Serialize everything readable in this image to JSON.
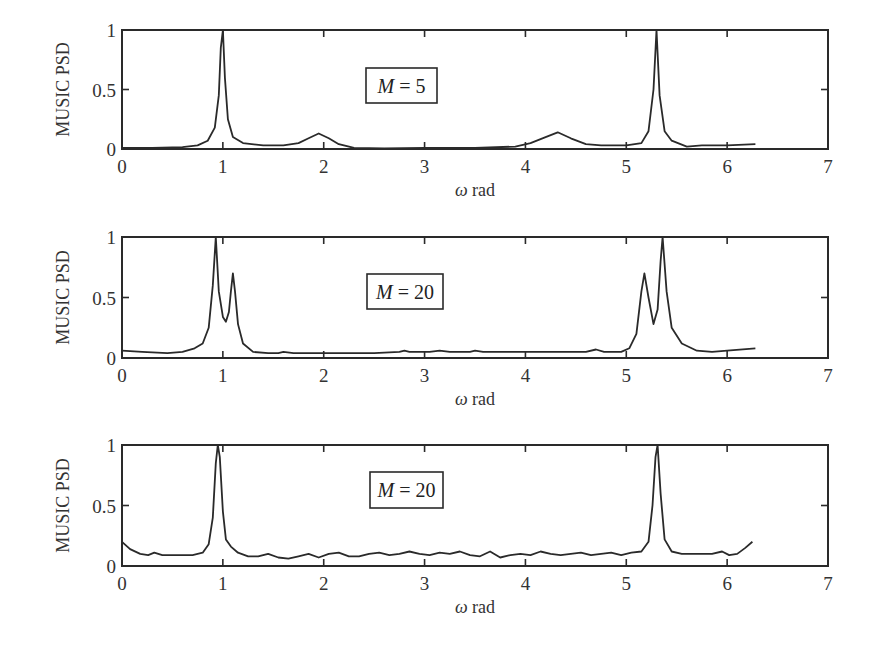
{
  "figure": {
    "panels": [
      {
        "id": "panel-1",
        "ylabel": "MUSIC PSD",
        "xlabel_symbol": "ω",
        "xlabel_unit": " rad",
        "annotation_var": "M",
        "annotation_rest": " = 5"
      },
      {
        "id": "panel-2",
        "ylabel": "MUSIC PSD",
        "xlabel_symbol": "ω",
        "xlabel_unit": " rad",
        "annotation_var": "M",
        "annotation_rest": " = 20"
      },
      {
        "id": "panel-3",
        "ylabel": "MUSIC PSD",
        "xlabel_symbol": "ω",
        "xlabel_unit": " rad",
        "annotation_var": "M",
        "annotation_rest": " = 20"
      }
    ]
  },
  "chart_data": [
    {
      "type": "line",
      "title": "",
      "annotation": "M = 5",
      "xlabel": "ω rad",
      "ylabel": "MUSIC PSD",
      "xlim": [
        0,
        7
      ],
      "ylim": [
        0,
        1
      ],
      "xticks": [
        "0",
        "1",
        "2",
        "3",
        "4",
        "5",
        "6",
        "7"
      ],
      "yticks": [
        "0",
        "0.5",
        "1"
      ],
      "grid": false,
      "series": [
        {
          "name": "MUSIC PSD (M = 5)",
          "x": [
            0,
            0.3,
            0.6,
            0.75,
            0.85,
            0.92,
            0.96,
            0.98,
            1.0,
            1.02,
            1.05,
            1.1,
            1.2,
            1.4,
            1.6,
            1.75,
            1.85,
            1.95,
            2.05,
            2.15,
            2.3,
            2.6,
            3.0,
            3.5,
            3.9,
            4.05,
            4.2,
            4.32,
            4.45,
            4.6,
            4.75,
            5.0,
            5.15,
            5.22,
            5.27,
            5.3,
            5.33,
            5.38,
            5.45,
            5.6,
            5.75,
            6.0,
            6.28
          ],
          "values": [
            0.01,
            0.01,
            0.015,
            0.03,
            0.07,
            0.18,
            0.45,
            0.85,
            1.0,
            0.6,
            0.25,
            0.1,
            0.05,
            0.03,
            0.03,
            0.05,
            0.09,
            0.13,
            0.09,
            0.04,
            0.01,
            0.005,
            0.01,
            0.01,
            0.02,
            0.05,
            0.1,
            0.14,
            0.09,
            0.04,
            0.03,
            0.03,
            0.05,
            0.15,
            0.5,
            1.0,
            0.45,
            0.15,
            0.07,
            0.02,
            0.03,
            0.03,
            0.04
          ]
        }
      ]
    },
    {
      "type": "line",
      "title": "",
      "annotation": "M = 20",
      "xlabel": "ω rad",
      "ylabel": "MUSIC PSD",
      "xlim": [
        0,
        7
      ],
      "ylim": [
        0,
        1
      ],
      "xticks": [
        "0",
        "1",
        "2",
        "3",
        "4",
        "5",
        "6",
        "7"
      ],
      "yticks": [
        "0",
        "0.5",
        "1"
      ],
      "grid": false,
      "series": [
        {
          "name": "MUSIC PSD (M = 20)",
          "x": [
            0,
            0.2,
            0.45,
            0.6,
            0.72,
            0.8,
            0.86,
            0.9,
            0.93,
            0.96,
            1.0,
            1.03,
            1.06,
            1.08,
            1.1,
            1.12,
            1.15,
            1.2,
            1.3,
            1.45,
            1.55,
            1.6,
            1.7,
            2.0,
            2.5,
            2.75,
            2.8,
            2.85,
            3.05,
            3.15,
            3.25,
            3.45,
            3.5,
            3.58,
            4.0,
            4.6,
            4.7,
            4.78,
            4.95,
            5.03,
            5.1,
            5.15,
            5.18,
            5.22,
            5.27,
            5.31,
            5.34,
            5.36,
            5.4,
            5.45,
            5.55,
            5.7,
            5.85,
            6.0,
            6.28
          ],
          "values": [
            0.06,
            0.05,
            0.04,
            0.05,
            0.08,
            0.12,
            0.25,
            0.6,
            1.0,
            0.55,
            0.34,
            0.3,
            0.38,
            0.55,
            0.7,
            0.55,
            0.28,
            0.12,
            0.05,
            0.04,
            0.04,
            0.05,
            0.04,
            0.04,
            0.04,
            0.05,
            0.06,
            0.05,
            0.05,
            0.06,
            0.05,
            0.05,
            0.06,
            0.05,
            0.05,
            0.05,
            0.07,
            0.05,
            0.05,
            0.08,
            0.2,
            0.55,
            0.7,
            0.5,
            0.28,
            0.4,
            0.8,
            1.0,
            0.55,
            0.25,
            0.12,
            0.06,
            0.05,
            0.06,
            0.08
          ]
        }
      ]
    },
    {
      "type": "line",
      "title": "",
      "annotation": "M = 20",
      "xlabel": "ω rad",
      "ylabel": "MUSIC PSD",
      "xlim": [
        0,
        7
      ],
      "ylim": [
        0,
        1
      ],
      "xticks": [
        "0",
        "1",
        "2",
        "3",
        "4",
        "5",
        "6",
        "7"
      ],
      "yticks": [
        "0",
        "0.5",
        "1"
      ],
      "grid": false,
      "series": [
        {
          "name": "MUSIC PSD (M = 20, noisy estimate)",
          "x": [
            0,
            0.08,
            0.18,
            0.26,
            0.32,
            0.4,
            0.55,
            0.7,
            0.8,
            0.86,
            0.9,
            0.93,
            0.95,
            0.97,
            1.0,
            1.03,
            1.08,
            1.15,
            1.25,
            1.35,
            1.45,
            1.55,
            1.65,
            1.75,
            1.85,
            1.95,
            2.05,
            2.15,
            2.25,
            2.35,
            2.45,
            2.55,
            2.65,
            2.75,
            2.85,
            2.95,
            3.05,
            3.15,
            3.25,
            3.35,
            3.45,
            3.55,
            3.65,
            3.75,
            3.85,
            3.95,
            4.05,
            4.15,
            4.25,
            4.35,
            4.45,
            4.55,
            4.65,
            4.75,
            4.85,
            4.95,
            5.05,
            5.15,
            5.22,
            5.26,
            5.29,
            5.31,
            5.34,
            5.38,
            5.45,
            5.55,
            5.7,
            5.85,
            5.95,
            6.02,
            6.1,
            6.18,
            6.25
          ],
          "values": [
            0.2,
            0.14,
            0.1,
            0.09,
            0.11,
            0.09,
            0.09,
            0.09,
            0.11,
            0.18,
            0.4,
            0.85,
            1.0,
            0.9,
            0.45,
            0.22,
            0.16,
            0.11,
            0.08,
            0.08,
            0.1,
            0.07,
            0.06,
            0.08,
            0.1,
            0.07,
            0.1,
            0.11,
            0.08,
            0.08,
            0.1,
            0.11,
            0.09,
            0.1,
            0.12,
            0.1,
            0.09,
            0.11,
            0.1,
            0.12,
            0.09,
            0.08,
            0.12,
            0.07,
            0.09,
            0.1,
            0.09,
            0.12,
            0.1,
            0.09,
            0.1,
            0.11,
            0.09,
            0.1,
            0.11,
            0.09,
            0.11,
            0.12,
            0.2,
            0.5,
            0.9,
            1.0,
            0.6,
            0.22,
            0.12,
            0.1,
            0.1,
            0.1,
            0.12,
            0.09,
            0.1,
            0.15,
            0.2
          ]
        }
      ]
    }
  ],
  "layout": {
    "panels": [
      {
        "top": 30,
        "bottom": 149,
        "annot_box": [
          366,
          68,
          71,
          35
        ]
      },
      {
        "top": 237,
        "bottom": 358,
        "annot_box": [
          367,
          274,
          76,
          35
        ]
      },
      {
        "top": 445,
        "bottom": 566,
        "annot_box": [
          370,
          472,
          73,
          36
        ]
      }
    ],
    "plot_left": 122,
    "plot_right": 828
  }
}
